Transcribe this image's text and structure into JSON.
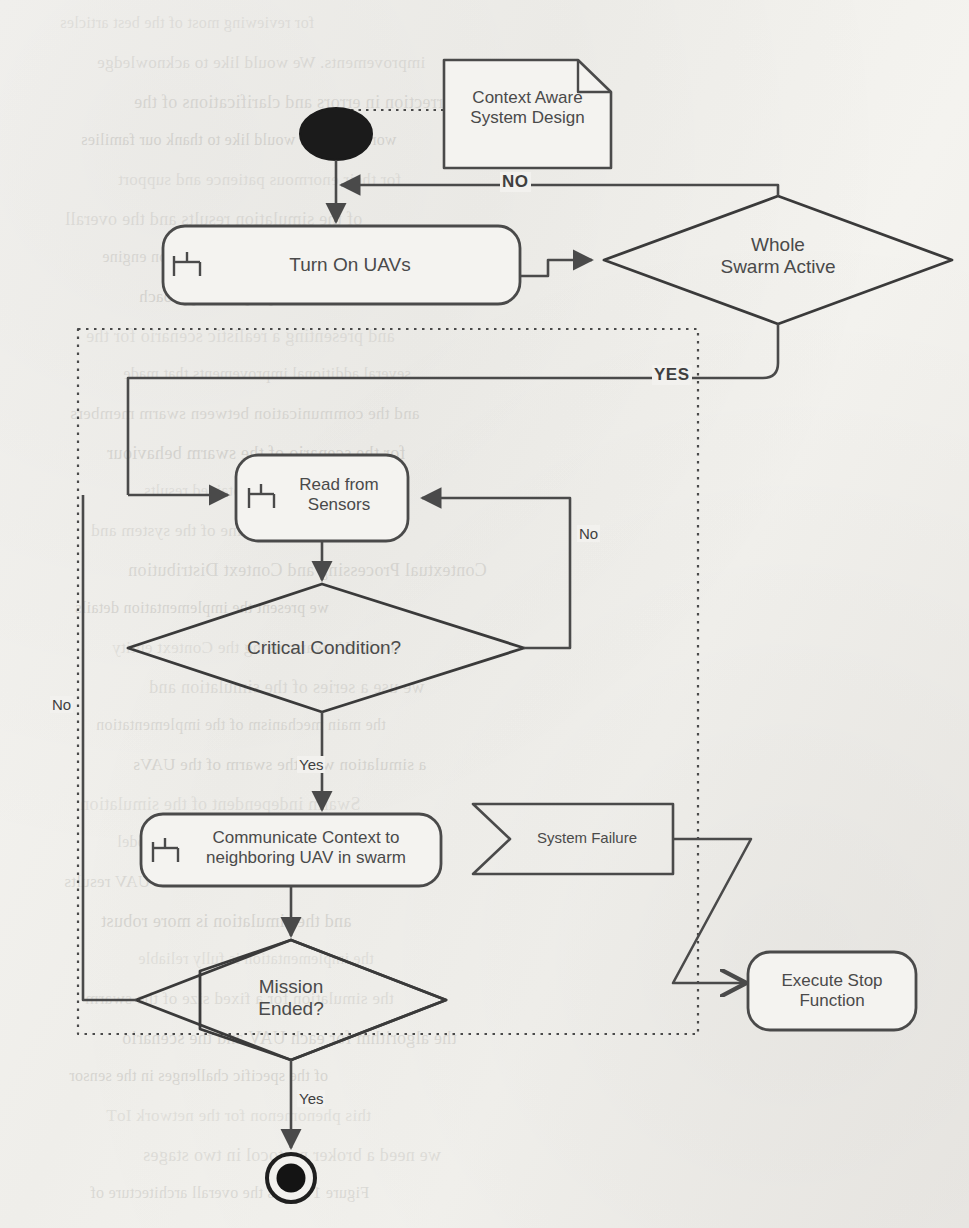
{
  "diagram": {
    "type": "uml-activity-diagram",
    "colors": {
      "paper": "#f2f1ee",
      "stroke": "#4a4a4a",
      "stroke_dark": "#3a3a3a",
      "text": "#4a4a4a",
      "node_fill": "#f4f3f0"
    }
  },
  "nodes": {
    "start": {
      "name": "initial-node",
      "shape": "filled-ellipse",
      "label": ""
    },
    "note": {
      "name": "context-aware-system-design-note",
      "shape": "note",
      "label": "Context Aware\nSystem Design"
    },
    "turn_on_uavs": {
      "name": "turn-on-uavs-activity",
      "shape": "rounded-rect",
      "label": "Turn On UAVs",
      "icon": "rake-subprocess-icon"
    },
    "whole_swarm_active": {
      "name": "whole-swarm-active-decision",
      "shape": "diamond",
      "label": "Whole\nSwarm Active"
    },
    "read_from_sensors": {
      "name": "read-from-sensors-activity",
      "shape": "rounded-rect",
      "label": "Read from\nSensors",
      "icon": "rake-subprocess-icon"
    },
    "critical_condition": {
      "name": "critical-condition-decision",
      "shape": "diamond",
      "label": "Critical Condition?"
    },
    "communicate_context": {
      "name": "communicate-context-activity",
      "shape": "rounded-rect",
      "label": "Communicate Context to\nneighboring UAV in swarm",
      "icon": "rake-subprocess-icon"
    },
    "system_failure": {
      "name": "system-failure-signal",
      "shape": "signal-receipt",
      "label": "System Failure"
    },
    "mission_ended": {
      "name": "mission-ended-decision",
      "shape": "diamond",
      "label": "Mission\nEnded?"
    },
    "execute_stop_function": {
      "name": "execute-stop-function-activity",
      "shape": "rounded-rect",
      "label": "Execute Stop\nFunction"
    },
    "end": {
      "name": "final-node",
      "shape": "ringed-filled-circle",
      "label": ""
    }
  },
  "edge_labels": {
    "no_top": "NO",
    "yes_swarm": "YES",
    "no_critical_right": "No",
    "no_mission_left": "No",
    "yes_critical": "Yes",
    "yes_mission": "Yes"
  },
  "regions": {
    "mission_loop": {
      "name": "mission-loop-region",
      "style": "dotted-boundary"
    }
  },
  "bleed_through_text": [
    "for reviewing most of the best articles",
    "improvements. We would like to acknowledge",
    "Correction in errors and clarifications of the",
    "work. Also we would like to thank our families",
    "for their enormous patience and support",
    "of the simulation results and the overall",
    "the development of the simulation engine",
    "extended evaluation of the proposed approach",
    "and presenting a realistic scenario for the",
    "several additional improvements that made",
    "and the communication between swarm members",
    "for the scenario of the swarm behaviour",
    "an evaluation of the obtained results",
    "the state machine of the system and",
    "Contextual Processing and Context Distribution",
    "we present the implementation details",
    "the UAV swarm using the Context entity",
    "we use a series of the simulation and",
    "the main mechanism of the implementation",
    "a simulation with the swarm of the UAVs",
    "Swarm independent of the simulation",
    "MATLAB and Simulink were used to model",
    "mode is of the obtained UAV results",
    "and the simulation is more robust",
    "the implementation is fully reliable",
    "the simulation for a fixed size of the swarm",
    "the algorithm for each UAV and the scenario",
    "of the specific challenges in the sensor",
    "this phenomenon for the network IoT",
    "we need a broker protocol in two stages",
    "Figure 1 shows the overall architecture of"
  ]
}
